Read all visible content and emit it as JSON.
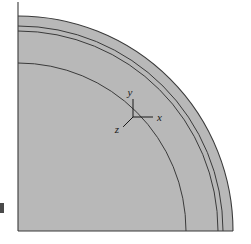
{
  "figure": {
    "kind": "engineering-section-diagram",
    "background_color": "#ffffff",
    "fill_color": "#b8b8b8",
    "line_color": "#3a3a3a",
    "artifact_color": "#4a4a4a"
  },
  "geometry": {
    "center_x": 18,
    "center_y": 231,
    "left_edge_x": 18,
    "bottom_edge_y": 231,
    "top_edge_y": 2,
    "right_extent_x": 233,
    "outer_radius": 215,
    "arc_radii": [
      215,
      205,
      200,
      168
    ],
    "quadrant": "upper-right",
    "sweep_degrees": 90
  },
  "axes_triad": {
    "origin_x": 133,
    "origin_y": 117,
    "arm_length_x": 20,
    "arm_length_y": 18,
    "arm_length_z": 14,
    "z_angle_degrees": 225,
    "labels": {
      "x": "x",
      "y": "y",
      "z": "z"
    }
  },
  "artifact": {
    "name": "page-edge-mark",
    "x": 0,
    "y": 203,
    "width": 4,
    "height": 10
  }
}
